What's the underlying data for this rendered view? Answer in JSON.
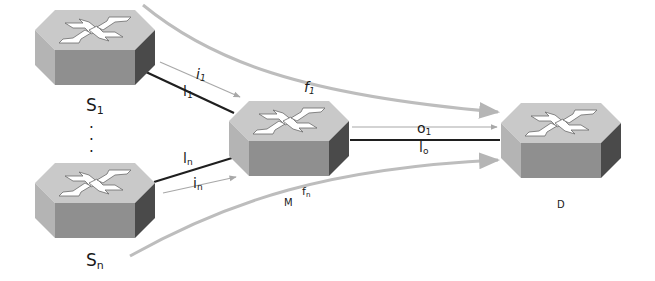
{
  "diagram": {
    "type": "network-topology",
    "colors": {
      "router_top": "#c9c9c9",
      "router_front": "#8f8f8f",
      "router_side": "#4a4a4a",
      "router_symbol": "#ffffff",
      "link_dark": "#1f1f1f",
      "flow_gray": "#b9b9b9",
      "thin_arrow": "#a8a8a8"
    },
    "nodes": [
      {
        "id": "S1",
        "label": "S",
        "sub": "1",
        "role": "source"
      },
      {
        "id": "Sn",
        "label": "S",
        "sub": "n",
        "role": "source"
      },
      {
        "id": "M",
        "label": "M",
        "role": "middle"
      },
      {
        "id": "D",
        "label": "D",
        "role": "destination"
      }
    ],
    "ellipsis": "⋮",
    "links": [
      {
        "id": "l1",
        "label": "l",
        "sub": "1",
        "from": "S1",
        "to": "M"
      },
      {
        "id": "ln",
        "label": "l",
        "sub": "n",
        "from": "Sn",
        "to": "M"
      },
      {
        "id": "lo",
        "label": "l",
        "sub": "o",
        "from": "M",
        "to": "D"
      }
    ],
    "input_flows": [
      {
        "id": "i1",
        "label": "i",
        "sub": "1",
        "from": "S1",
        "to": "M"
      },
      {
        "id": "in",
        "label": "i",
        "sub": "n",
        "from": "Sn",
        "to": "M"
      }
    ],
    "output_flows": [
      {
        "id": "o1",
        "label": "o",
        "sub": "1",
        "from": "M",
        "to": "D"
      }
    ],
    "end_to_end_flows": [
      {
        "id": "f1",
        "label": "f",
        "sub": "1",
        "from": "S1",
        "to": "D"
      },
      {
        "id": "fn",
        "label": "f",
        "sub": "n",
        "from": "Sn",
        "to": "D"
      }
    ]
  }
}
